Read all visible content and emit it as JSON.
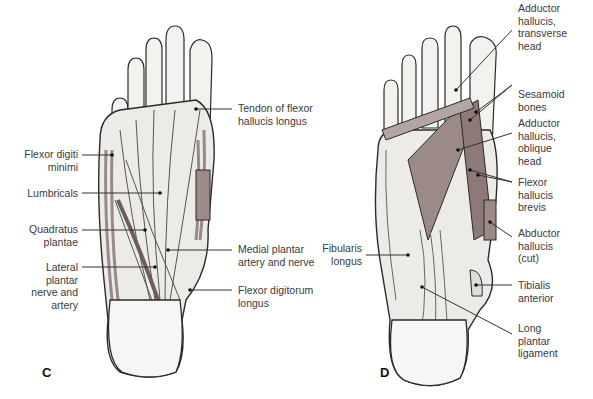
{
  "figure": {
    "panels": [
      {
        "letter": "C",
        "labels": {
          "flexor_digiti_minimi": "Flexor digiti\nminimi",
          "lumbricals": "Lumbricals",
          "quadratus_plantae": "Quadratus\nplantae",
          "lateral_plantar": "Lateral\nplantar\nnerve and\nartery",
          "tendon_fhl": "Tendon of flexor\nhallucis longus",
          "medial_plantar": "Medial plantar\nartery and nerve",
          "fdl": "Flexor digitorum\nlongus"
        }
      },
      {
        "letter": "D",
        "labels": {
          "add_transverse": "Adductor\nhallucis,\ntransverse\nhead",
          "sesamoid": "Sesamoid\nbones",
          "add_oblique": "Adductor\nhallucis,\noblique\nhead",
          "fhb": "Flexor\nhallucis\nbrevis",
          "abd_cut": "Abductor\nhallucis\n(cut)",
          "fibularis": "Fibularis\nlongus",
          "tibialis": "Tibialis\nanterior",
          "long_plantar": "Long\nplantar\nligament"
        }
      }
    ],
    "colors": {
      "outline": "#2a2a2a",
      "bone": "#f4f2ef",
      "tendon": "#e6e4e1",
      "muscle": "#9c8a86",
      "muscle_dark": "#7f6b67",
      "leader": "#333333"
    }
  }
}
